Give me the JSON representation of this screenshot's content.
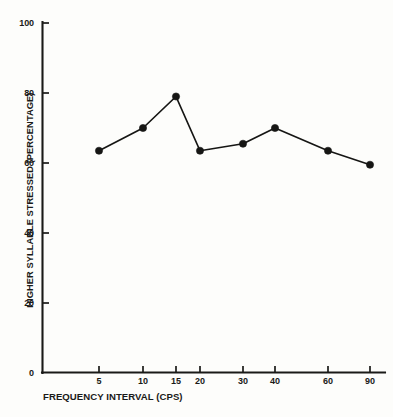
{
  "chart_data": {
    "type": "line",
    "title": "",
    "xlabel": "FREQUENCY INTERVAL (CPS)",
    "ylabel": "HIGHER SYLLABLE STRESSED (PERCENTAGE)",
    "categories": [
      "5",
      "10",
      "15",
      "20",
      "30",
      "40",
      "60",
      "90"
    ],
    "x": [
      5,
      10,
      15,
      20,
      30,
      40,
      60,
      90
    ],
    "values": [
      63.5,
      70,
      79,
      63.5,
      65.5,
      70,
      63.5,
      59.5
    ],
    "series": [
      {
        "name": "Higher syllable stressed",
        "values": [
          63.5,
          70,
          79,
          63.5,
          65.5,
          70,
          63.5,
          59.5
        ]
      }
    ],
    "ylim": [
      0,
      100
    ],
    "yticks": [
      0,
      20,
      40,
      60,
      80,
      100
    ],
    "ytick_labels": [
      "0",
      "20",
      "40",
      "60",
      "80",
      "100"
    ],
    "xtick_labels": [
      "5",
      "10",
      "15",
      "20",
      "30",
      "40",
      "60",
      "90"
    ],
    "grid": false,
    "legend": "none",
    "marker": "filled-circle",
    "line_color": "#161614",
    "marker_color": "#161614",
    "background_color": "#fdfdfb",
    "axis_color": "#1a1a18"
  },
  "axes": {
    "y_title": "HIGHER SYLLABLE STRESSED (PERCENTAGE)",
    "x_title": "FREQUENCY INTERVAL (CPS)"
  }
}
